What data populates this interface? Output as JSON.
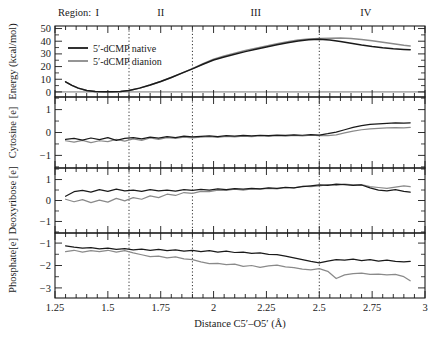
{
  "figure": {
    "region_prefix": "Region:",
    "regions": [
      {
        "label": "I",
        "x_center": 1.45
      },
      {
        "label": "II",
        "x_center": 1.75
      },
      {
        "label": "III",
        "x_center": 2.2
      },
      {
        "label": "IV",
        "x_center": 2.72
      }
    ],
    "region_dividers": [
      1.6,
      1.9,
      2.5
    ],
    "xaxis": {
      "label": "Distance C5′–O5′ (Å)",
      "min": 1.25,
      "max": 3.0,
      "ticks": [
        1.25,
        1.5,
        1.75,
        2.0,
        2.25,
        2.5,
        2.75,
        3
      ],
      "tick_labels": [
        "1.25",
        "1.5",
        "1.75",
        "2",
        "2.25",
        "2.5",
        "2.75",
        "3"
      ],
      "minor_tick_step": 0.05
    },
    "legend": {
      "position": "top-left-panel1",
      "entries": [
        {
          "label": "5′-dCMP native",
          "color": "#1a1a1a"
        },
        {
          "label": "5′-dCMP dianion",
          "color": "#8a8a8a"
        }
      ]
    },
    "colors": {
      "native": "#1a1a1a",
      "dianion": "#8a8a8a",
      "axis": "#1a1a1a",
      "divider": "#333333",
      "background": "#ffffff"
    }
  },
  "chart_data": [
    {
      "type": "line",
      "panel": 1,
      "title": "",
      "xlabel": "Distance C5′–O5′ (Å)",
      "ylabel": "Energy (kcal/mol)",
      "xlim": [
        1.25,
        3.0
      ],
      "ylim": [
        -4,
        52
      ],
      "yticks": [
        0,
        10,
        20,
        30,
        40,
        50
      ],
      "ytick_labels": [
        "0",
        "10",
        "20",
        "30",
        "40",
        "50"
      ],
      "grid": false,
      "series": [
        {
          "name": "5′-dCMP native",
          "color": "#1a1a1a",
          "x": [
            1.3,
            1.33,
            1.36,
            1.4,
            1.44,
            1.48,
            1.52,
            1.56,
            1.6,
            1.65,
            1.7,
            1.75,
            1.8,
            1.85,
            1.9,
            1.95,
            2.0,
            2.05,
            2.1,
            2.15,
            2.2,
            2.25,
            2.3,
            2.35,
            2.4,
            2.45,
            2.5,
            2.55,
            2.6,
            2.65,
            2.7,
            2.75,
            2.8,
            2.85,
            2.9,
            2.93
          ],
          "y": [
            8.0,
            5.2,
            3.0,
            1.2,
            0.4,
            0.1,
            0.1,
            0.3,
            1.2,
            3.0,
            5.4,
            8.2,
            11.4,
            14.8,
            18.2,
            21.8,
            25.2,
            27.6,
            29.8,
            31.8,
            33.6,
            35.4,
            37.2,
            38.8,
            40.2,
            41.2,
            41.6,
            41.0,
            39.8,
            38.4,
            37.0,
            35.8,
            34.8,
            34.0,
            33.5,
            33.3
          ]
        },
        {
          "name": "5′-dCMP dianion",
          "color": "#8a8a8a",
          "x": [
            1.3,
            1.33,
            1.36,
            1.4,
            1.44,
            1.48,
            1.52,
            1.56,
            1.6,
            1.65,
            1.7,
            1.75,
            1.8,
            1.85,
            1.9,
            1.95,
            2.0,
            2.05,
            2.1,
            2.15,
            2.2,
            2.25,
            2.3,
            2.35,
            2.4,
            2.45,
            2.5,
            2.55,
            2.6,
            2.65,
            2.7,
            2.75,
            2.8,
            2.85,
            2.9,
            2.93
          ],
          "y": [
            8.0,
            5.2,
            3.0,
            1.2,
            0.4,
            0.1,
            0.1,
            0.3,
            1.2,
            3.0,
            5.4,
            8.2,
            11.4,
            14.8,
            18.4,
            22.2,
            25.8,
            28.4,
            30.6,
            32.6,
            34.4,
            36.2,
            38.0,
            39.6,
            41.0,
            41.8,
            42.1,
            42.4,
            42.6,
            42.2,
            41.4,
            40.4,
            39.2,
            38.0,
            36.8,
            36.3
          ]
        }
      ]
    },
    {
      "type": "line",
      "panel": 2,
      "title": "",
      "ylabel": "Cytosine [e]",
      "xlim": [
        1.25,
        3.0
      ],
      "ylim": [
        -1.55,
        1.55
      ],
      "yticks": [
        -1,
        0,
        1
      ],
      "ytick_labels": [
        "−1",
        "0",
        "1"
      ],
      "grid": false,
      "series": [
        {
          "name": "5′-dCMP native",
          "color": "#1a1a1a",
          "x": [
            1.3,
            1.34,
            1.38,
            1.42,
            1.46,
            1.5,
            1.54,
            1.58,
            1.62,
            1.66,
            1.7,
            1.74,
            1.78,
            1.82,
            1.86,
            1.9,
            1.94,
            1.98,
            2.02,
            2.06,
            2.1,
            2.14,
            2.18,
            2.22,
            2.26,
            2.3,
            2.34,
            2.38,
            2.42,
            2.46,
            2.5,
            2.54,
            2.58,
            2.62,
            2.66,
            2.7,
            2.74,
            2.78,
            2.82,
            2.86,
            2.9,
            2.93
          ],
          "y": [
            -0.3,
            -0.26,
            -0.33,
            -0.24,
            -0.31,
            -0.22,
            -0.34,
            -0.26,
            -0.22,
            -0.28,
            -0.2,
            -0.25,
            -0.18,
            -0.22,
            -0.16,
            -0.19,
            -0.17,
            -0.15,
            -0.18,
            -0.14,
            -0.16,
            -0.13,
            -0.15,
            -0.12,
            -0.14,
            -0.11,
            -0.13,
            -0.1,
            -0.12,
            -0.09,
            -0.11,
            -0.05,
            0.02,
            0.12,
            0.22,
            0.3,
            0.35,
            0.38,
            0.4,
            0.42,
            0.41,
            0.42
          ]
        },
        {
          "name": "5′-dCMP dianion",
          "color": "#8a8a8a",
          "x": [
            1.3,
            1.34,
            1.38,
            1.42,
            1.46,
            1.5,
            1.54,
            1.58,
            1.62,
            1.66,
            1.7,
            1.74,
            1.78,
            1.82,
            1.86,
            1.9,
            1.94,
            1.98,
            2.02,
            2.06,
            2.1,
            2.14,
            2.18,
            2.22,
            2.26,
            2.3,
            2.34,
            2.38,
            2.42,
            2.46,
            2.5,
            2.54,
            2.58,
            2.62,
            2.66,
            2.7,
            2.74,
            2.78,
            2.82,
            2.86,
            2.9,
            2.93
          ],
          "y": [
            -0.36,
            -0.42,
            -0.34,
            -0.44,
            -0.36,
            -0.4,
            -0.3,
            -0.38,
            -0.28,
            -0.34,
            -0.24,
            -0.3,
            -0.22,
            -0.26,
            -0.2,
            -0.23,
            -0.2,
            -0.18,
            -0.21,
            -0.17,
            -0.19,
            -0.16,
            -0.18,
            -0.15,
            -0.17,
            -0.14,
            -0.16,
            -0.13,
            -0.15,
            -0.12,
            -0.14,
            -0.14,
            -0.1,
            -0.02,
            0.06,
            0.12,
            0.16,
            0.18,
            0.2,
            0.21,
            0.2,
            0.22
          ]
        }
      ]
    },
    {
      "type": "line",
      "panel": 3,
      "title": "",
      "ylabel": "Deoxyribose [e]",
      "xlim": [
        1.25,
        3.0
      ],
      "ylim": [
        -1.55,
        1.55
      ],
      "yticks": [
        -1,
        0,
        1
      ],
      "ytick_labels": [
        "−1",
        "0",
        "1"
      ],
      "grid": false,
      "series": [
        {
          "name": "5′-dCMP native",
          "color": "#1a1a1a",
          "x": [
            1.3,
            1.34,
            1.38,
            1.42,
            1.46,
            1.5,
            1.54,
            1.58,
            1.62,
            1.66,
            1.7,
            1.74,
            1.78,
            1.82,
            1.86,
            1.9,
            1.94,
            1.98,
            2.02,
            2.06,
            2.1,
            2.14,
            2.18,
            2.22,
            2.26,
            2.3,
            2.34,
            2.38,
            2.42,
            2.46,
            2.5,
            2.54,
            2.58,
            2.62,
            2.66,
            2.7,
            2.74,
            2.78,
            2.82,
            2.86,
            2.9,
            2.93
          ],
          "y": [
            0.2,
            0.42,
            0.48,
            0.4,
            0.52,
            0.44,
            0.54,
            0.46,
            0.5,
            0.44,
            0.52,
            0.46,
            0.5,
            0.45,
            0.52,
            0.48,
            0.53,
            0.5,
            0.55,
            0.52,
            0.57,
            0.54,
            0.58,
            0.56,
            0.6,
            0.58,
            0.63,
            0.6,
            0.66,
            0.7,
            0.74,
            0.72,
            0.78,
            0.76,
            0.72,
            0.74,
            0.6,
            0.5,
            0.46,
            0.52,
            0.44,
            0.4
          ]
        },
        {
          "name": "5′-dCMP dianion",
          "color": "#8a8a8a",
          "x": [
            1.3,
            1.34,
            1.38,
            1.42,
            1.46,
            1.5,
            1.54,
            1.58,
            1.62,
            1.66,
            1.7,
            1.74,
            1.78,
            1.82,
            1.86,
            1.9,
            1.94,
            1.98,
            2.02,
            2.06,
            2.1,
            2.14,
            2.18,
            2.22,
            2.26,
            2.3,
            2.34,
            2.38,
            2.42,
            2.46,
            2.5,
            2.54,
            2.58,
            2.62,
            2.66,
            2.7,
            2.74,
            2.78,
            2.82,
            2.86,
            2.9,
            2.93
          ],
          "y": [
            0.06,
            -0.06,
            0.04,
            -0.1,
            0.02,
            -0.08,
            0.1,
            -0.02,
            0.14,
            0.06,
            0.22,
            0.14,
            0.3,
            0.24,
            0.38,
            0.34,
            0.44,
            0.42,
            0.5,
            0.48,
            0.54,
            0.5,
            0.56,
            0.54,
            0.58,
            0.56,
            0.62,
            0.6,
            0.68,
            0.66,
            0.7,
            0.76,
            0.72,
            0.78,
            0.74,
            0.76,
            0.66,
            0.62,
            0.58,
            0.64,
            0.7,
            0.66
          ]
        }
      ]
    },
    {
      "type": "line",
      "panel": 4,
      "title": "",
      "ylabel": "Phosphate[e]",
      "xlim": [
        1.25,
        3.0
      ],
      "ylim": [
        -3.45,
        -0.55
      ],
      "yticks": [
        -3,
        -2,
        -1
      ],
      "ytick_labels": [
        "−3",
        "−2",
        "−1"
      ],
      "grid": false,
      "series": [
        {
          "name": "5′-dCMP native",
          "color": "#1a1a1a",
          "x": [
            1.3,
            1.34,
            1.38,
            1.42,
            1.46,
            1.5,
            1.54,
            1.58,
            1.62,
            1.66,
            1.7,
            1.74,
            1.78,
            1.82,
            1.86,
            1.9,
            1.94,
            1.98,
            2.02,
            2.06,
            2.1,
            2.14,
            2.18,
            2.22,
            2.26,
            2.3,
            2.34,
            2.38,
            2.42,
            2.46,
            2.5,
            2.54,
            2.58,
            2.62,
            2.66,
            2.7,
            2.74,
            2.78,
            2.82,
            2.86,
            2.9,
            2.93
          ],
          "y": [
            -1.12,
            -1.18,
            -1.22,
            -1.2,
            -1.26,
            -1.22,
            -1.28,
            -1.25,
            -1.3,
            -1.27,
            -1.32,
            -1.28,
            -1.34,
            -1.3,
            -1.36,
            -1.32,
            -1.38,
            -1.34,
            -1.4,
            -1.36,
            -1.42,
            -1.4,
            -1.46,
            -1.44,
            -1.5,
            -1.52,
            -1.58,
            -1.66,
            -1.74,
            -1.82,
            -1.88,
            -1.8,
            -1.74,
            -1.76,
            -1.72,
            -1.78,
            -1.74,
            -1.8,
            -1.76,
            -1.82,
            -1.84,
            -1.82
          ]
        },
        {
          "name": "5′-dCMP dianion",
          "color": "#8a8a8a",
          "x": [
            1.3,
            1.34,
            1.38,
            1.42,
            1.46,
            1.5,
            1.54,
            1.58,
            1.62,
            1.66,
            1.7,
            1.74,
            1.78,
            1.82,
            1.86,
            1.9,
            1.94,
            1.98,
            2.02,
            2.06,
            2.1,
            2.14,
            2.18,
            2.22,
            2.26,
            2.3,
            2.34,
            2.38,
            2.42,
            2.46,
            2.5,
            2.54,
            2.58,
            2.62,
            2.66,
            2.7,
            2.74,
            2.78,
            2.82,
            2.86,
            2.9,
            2.93
          ],
          "y": [
            -1.38,
            -1.32,
            -1.4,
            -1.34,
            -1.38,
            -1.32,
            -1.4,
            -1.34,
            -1.44,
            -1.52,
            -1.6,
            -1.58,
            -1.66,
            -1.62,
            -1.7,
            -1.74,
            -1.84,
            -1.92,
            -1.9,
            -1.96,
            -1.94,
            -2.04,
            -2.0,
            -2.08,
            -2.02,
            -1.98,
            -2.06,
            -2.1,
            -2.16,
            -2.2,
            -2.14,
            -2.26,
            -2.58,
            -2.42,
            -2.36,
            -2.34,
            -2.4,
            -2.38,
            -2.42,
            -2.4,
            -2.5,
            -2.68
          ]
        }
      ]
    }
  ]
}
